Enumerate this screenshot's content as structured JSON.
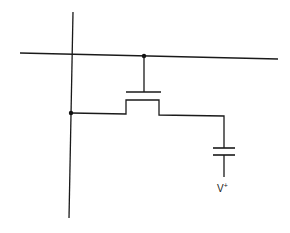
{
  "diagram": {
    "components": [
      {
        "type": "bit-line",
        "orientation": "vertical"
      },
      {
        "type": "word-line",
        "orientation": "horizontal"
      },
      {
        "type": "access-transistor",
        "symbol": "MOSFET"
      },
      {
        "type": "storage-capacitor"
      }
    ],
    "labels": {
      "supply": "V",
      "supply_sup": "+"
    },
    "colors": {
      "line": "#1a1a1a",
      "background": "#ffffff"
    }
  }
}
